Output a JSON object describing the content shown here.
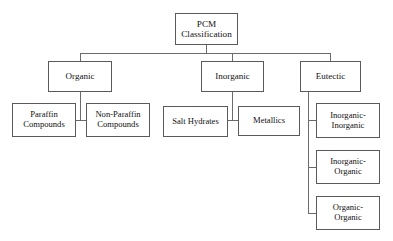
{
  "diagram": {
    "type": "tree",
    "title": "PCM Classification",
    "orientation": "top-down",
    "background_color": "#ffffff",
    "box_border_color": "#5a5a5a",
    "connector_color": "#6b6b6b",
    "text_color": "#111111",
    "levels": 3
  },
  "nodes": {
    "root": {
      "label": "PCM\nClassification",
      "line1": "PCM",
      "line2": "Classification",
      "level": 0
    },
    "organic": {
      "label": "Organic",
      "level": 1
    },
    "inorganic": {
      "label": "Inorganic",
      "level": 1
    },
    "eutectic": {
      "label": "Eutectic",
      "level": 1
    },
    "paraffin_compounds": {
      "label": "Paraffin\nCompounds",
      "line1": "Paraffin",
      "line2": "Compounds",
      "level": 2,
      "parent": "Organic"
    },
    "non_paraffin_compounds": {
      "label": "Non-Paraffin\nCompounds",
      "line1": "Non-Paraffin",
      "line2": "Compounds",
      "level": 2,
      "parent": "Organic"
    },
    "salt_hydrates": {
      "label": "Salt Hydrates",
      "level": 2,
      "parent": "Inorganic"
    },
    "metallics": {
      "label": "Metallics",
      "level": 2,
      "parent": "Inorganic"
    },
    "inorganic_inorganic": {
      "label": "Inorganic-\nInorganic",
      "line1": "Inorganic-",
      "line2": "Inorganic",
      "level": 2,
      "parent": "Eutectic"
    },
    "inorganic_organic": {
      "label": "Inorganic-\nOrganic",
      "line1": "Inorganic-",
      "line2": "Organic",
      "level": 2,
      "parent": "Eutectic"
    },
    "organic_organic": {
      "label": "Organic-\nOrganic",
      "line1": "Organic-",
      "line2": "Organic",
      "level": 2,
      "parent": "Eutectic"
    }
  },
  "edges": [
    {
      "from": "PCM Classification",
      "to": "Organic"
    },
    {
      "from": "PCM Classification",
      "to": "Inorganic"
    },
    {
      "from": "PCM Classification",
      "to": "Eutectic"
    },
    {
      "from": "Organic",
      "to": "Paraffin Compounds"
    },
    {
      "from": "Organic",
      "to": "Non-Paraffin Compounds"
    },
    {
      "from": "Inorganic",
      "to": "Salt Hydrates"
    },
    {
      "from": "Inorganic",
      "to": "Metallics"
    },
    {
      "from": "Eutectic",
      "to": "Inorganic-Inorganic"
    },
    {
      "from": "Eutectic",
      "to": "Inorganic-Organic"
    },
    {
      "from": "Eutectic",
      "to": "Organic-Organic"
    }
  ]
}
